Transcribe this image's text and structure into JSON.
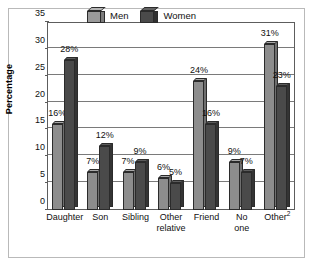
{
  "chart_data": {
    "type": "bar",
    "title": "",
    "xlabel": "",
    "ylabel": "Percentage",
    "ylim": [
      0,
      35
    ],
    "yticks": [
      0,
      5,
      10,
      15,
      20,
      25,
      30,
      35
    ],
    "ytick_labels": [
      "0",
      "5",
      "10",
      "15",
      "20",
      "25",
      "30",
      "35"
    ],
    "grid": true,
    "legend_position": "top-center",
    "categories": [
      "Daughter",
      "Son",
      "Sibling",
      "Other relative",
      "Friend",
      "No one",
      "Other²"
    ],
    "category_lines": [
      [
        "Daughter"
      ],
      [
        "Son"
      ],
      [
        "Sibling"
      ],
      [
        "Other",
        "relative"
      ],
      [
        "Friend"
      ],
      [
        "No",
        "one"
      ],
      [
        "Other2"
      ]
    ],
    "series": [
      {
        "name": "Men",
        "color": "#8d8d8d",
        "values": [
          16,
          7,
          7,
          6,
          24,
          9,
          31
        ],
        "labels": [
          "16%",
          "7%",
          "7%",
          "6%",
          "24%",
          "9%",
          "31%"
        ]
      },
      {
        "name": "Women",
        "color": "#4a4a4a",
        "values": [
          28,
          12,
          9,
          5,
          16,
          7,
          23
        ],
        "labels": [
          "28%",
          "12%",
          "9%",
          "5%",
          "16%",
          "7%",
          "23%"
        ]
      }
    ]
  },
  "legend": {
    "items": [
      {
        "label": "Men",
        "icon": "cube-icon-light"
      },
      {
        "label": "Women",
        "icon": "cube-icon-dark"
      }
    ]
  },
  "axis": {
    "y_title": "Percentage"
  }
}
